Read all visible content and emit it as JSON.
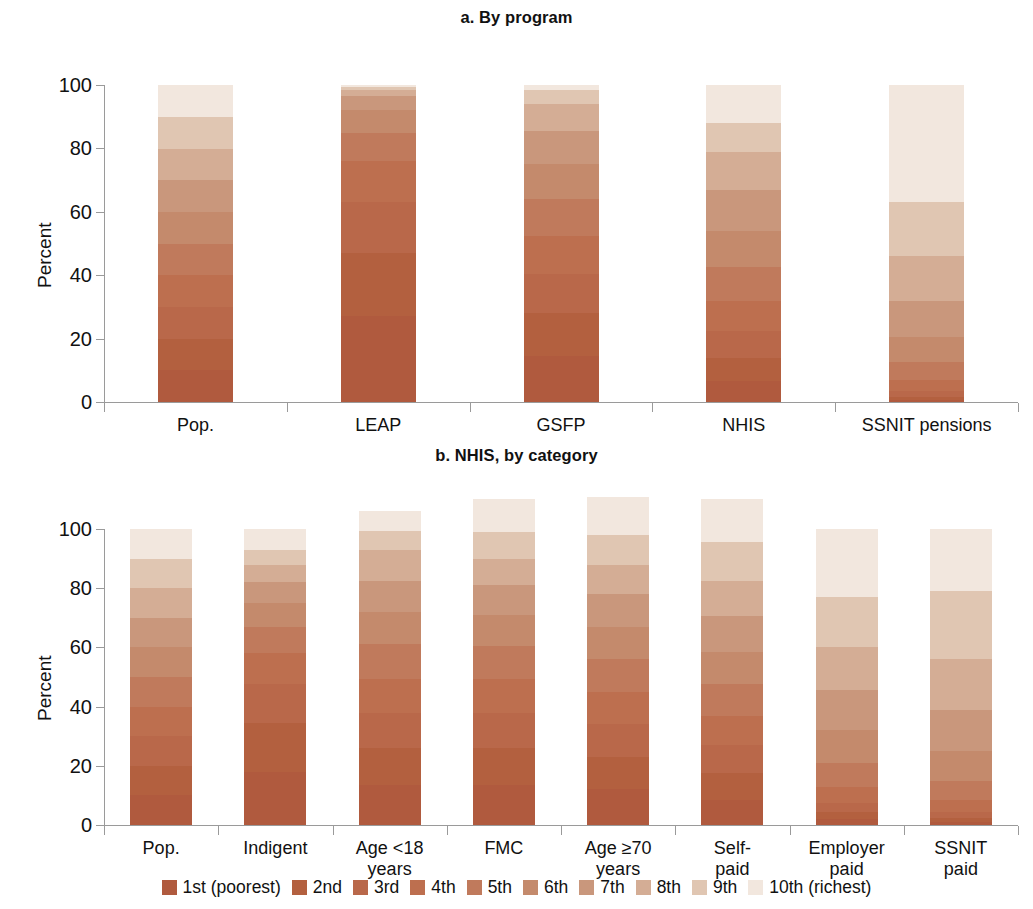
{
  "figure": {
    "y_axis_title": "Percent",
    "y_ticks": [
      0,
      20,
      40,
      60,
      80,
      100
    ]
  },
  "legend": {
    "items": [
      {
        "label": "1st (poorest)",
        "color": "#b05a3e"
      },
      {
        "label": "2nd",
        "color": "#b3603f"
      },
      {
        "label": "3rd",
        "color": "#b9684a"
      },
      {
        "label": "4th",
        "color": "#bd6f4f"
      },
      {
        "label": "5th",
        "color": "#c07a5c"
      },
      {
        "label": "6th",
        "color": "#c48a6c"
      },
      {
        "label": "7th",
        "color": "#c9977c"
      },
      {
        "label": "8th",
        "color": "#d4ad95"
      },
      {
        "label": "9th",
        "color": "#e0c6b2"
      },
      {
        "label": "10th (richest)",
        "color": "#f2e7de"
      }
    ]
  },
  "chart_data": [
    {
      "type": "bar",
      "id": "panel-a",
      "title": "a. By program",
      "stacked": true,
      "stack_mode": "percent",
      "xlabel": "",
      "ylabel": "Percent",
      "ylim": [
        0,
        100
      ],
      "yticks": [
        0,
        20,
        40,
        60,
        80,
        100
      ],
      "grid": false,
      "legend_position": "bottom",
      "categories": [
        "Pop.",
        "LEAP",
        "GSFP",
        "NHIS",
        "SSNIT pensions"
      ],
      "series": [
        {
          "name": "1st (poorest)",
          "color": "#b05a3e",
          "values": [
            10.0,
            27.0,
            14.5,
            6.5,
            0.5
          ]
        },
        {
          "name": "2nd",
          "color": "#b3603f",
          "values": [
            10.0,
            20.0,
            13.5,
            7.5,
            1.0
          ]
        },
        {
          "name": "3rd",
          "color": "#b9684a",
          "values": [
            10.0,
            16.0,
            12.5,
            8.5,
            2.0
          ]
        },
        {
          "name": "4th",
          "color": "#bd6f4f",
          "values": [
            10.0,
            13.0,
            12.0,
            9.5,
            3.5
          ]
        },
        {
          "name": "5th",
          "color": "#c07a5c",
          "values": [
            10.0,
            9.0,
            11.5,
            10.5,
            5.5
          ]
        },
        {
          "name": "6th",
          "color": "#c48a6c",
          "values": [
            10.0,
            7.0,
            11.0,
            11.5,
            8.0
          ]
        },
        {
          "name": "7th",
          "color": "#c9977c",
          "values": [
            10.0,
            4.5,
            10.5,
            13.0,
            11.5
          ]
        },
        {
          "name": "8th",
          "color": "#d4ad95",
          "values": [
            10.0,
            2.0,
            8.5,
            12.0,
            14.0
          ]
        },
        {
          "name": "9th",
          "color": "#e0c6b2",
          "values": [
            10.0,
            1.0,
            4.5,
            9.0,
            17.0
          ]
        },
        {
          "name": "10th (richest)",
          "color": "#f2e7de",
          "values": [
            10.0,
            0.5,
            1.5,
            12.0,
            37.0
          ]
        }
      ]
    },
    {
      "type": "bar",
      "id": "panel-b",
      "title": "b. NHIS, by category",
      "stacked": true,
      "stack_mode": "percent",
      "xlabel": "",
      "ylabel": "Percent",
      "ylim": [
        0,
        100
      ],
      "yticks": [
        0,
        20,
        40,
        60,
        80,
        100
      ],
      "grid": false,
      "legend_position": "bottom",
      "categories": [
        "Pop.",
        "Indigent",
        "Age <18\nyears",
        "FMC",
        "Age ≥70\nyears",
        "Self-\npaid",
        "Employer\npaid",
        "SSNIT\npaid"
      ],
      "series": [
        {
          "name": "1st (poorest)",
          "color": "#b05a3e",
          "values": [
            10.0,
            18.0,
            13.5,
            13.5,
            12.0,
            8.5,
            2.0,
            1.0
          ]
        },
        {
          "name": "2nd",
          "color": "#b3603f",
          "values": [
            10.0,
            16.5,
            12.5,
            12.5,
            11.0,
            9.0,
            2.5,
            1.5
          ]
        },
        {
          "name": "3rd",
          "color": "#b9684a",
          "values": [
            10.0,
            13.0,
            12.0,
            12.0,
            11.0,
            9.5,
            3.0,
            2.0
          ]
        },
        {
          "name": "4th",
          "color": "#bd6f4f",
          "values": [
            10.0,
            10.5,
            11.5,
            11.5,
            11.0,
            10.0,
            5.5,
            4.0
          ]
        },
        {
          "name": "5th",
          "color": "#c07a5c",
          "values": [
            10.0,
            9.0,
            11.5,
            11.0,
            11.0,
            10.5,
            8.0,
            6.5
          ]
        },
        {
          "name": "6th",
          "color": "#c48a6c",
          "values": [
            10.0,
            8.0,
            11.0,
            10.5,
            11.0,
            11.0,
            11.0,
            10.0
          ]
        },
        {
          "name": "7th",
          "color": "#c9977c",
          "values": [
            10.0,
            7.0,
            10.5,
            10.0,
            11.0,
            12.0,
            13.5,
            14.0
          ]
        },
        {
          "name": "8th",
          "color": "#d4ad95",
          "values": [
            10.0,
            6.0,
            10.5,
            9.0,
            10.0,
            12.0,
            14.5,
            17.0
          ]
        },
        {
          "name": "9th",
          "color": "#e0c6b2",
          "values": [
            10.0,
            5.0,
            6.5,
            9.0,
            10.0,
            13.0,
            17.0,
            23.0
          ]
        },
        {
          "name": "10th (richest)",
          "color": "#f2e7de",
          "values": [
            10.0,
            7.0,
            6.5,
            11.0,
            13.0,
            14.5,
            23.0,
            21.0
          ]
        }
      ]
    }
  ]
}
